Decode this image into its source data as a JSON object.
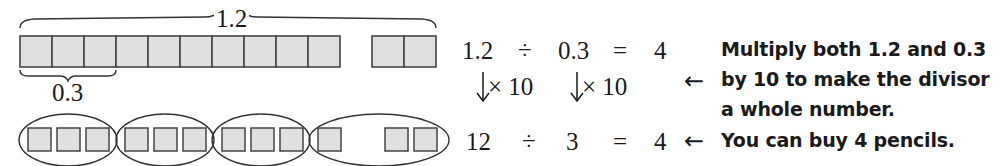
{
  "diagram": {
    "top_bar": {
      "brace_label": "1.2",
      "main_cells": 10,
      "extra_cells": 2,
      "sub_brace_label": "0.3",
      "sub_brace_cells": 3
    },
    "bottom_row": {
      "groups": [
        {
          "cells": 3
        },
        {
          "cells": 3
        },
        {
          "cells": 3
        },
        {
          "cells": 3,
          "note": "1 cell, gap, 2 cells"
        }
      ]
    },
    "colors": {
      "cell_fill": "#e0e0e0",
      "cell_border": "#444444",
      "line": "#333333",
      "text": "#1a1a1a"
    }
  },
  "equations": {
    "row1": {
      "dividend": "1.2",
      "op": "÷",
      "divisor": "0.3",
      "eq": "=",
      "result": "4"
    },
    "scale": {
      "left_arrow": "↓",
      "left_label": "× 10",
      "right_arrow": "↓",
      "right_label": "× 10"
    },
    "row2": {
      "dividend": "12",
      "op": "÷",
      "divisor": "3",
      "eq": "=",
      "result": "4"
    }
  },
  "notes": {
    "arrow": "←",
    "note1_lines": [
      "Multiply both 1.2 and 0.3",
      "by 10 to make the divisor",
      "a whole number."
    ],
    "note2": "You can buy 4 pencils."
  }
}
